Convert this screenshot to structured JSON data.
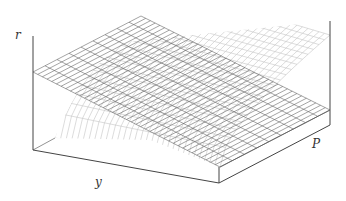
{
  "figure": {
    "type": "3d-surface-plot",
    "axes": {
      "vertical_label": "r",
      "front_label": "y",
      "side_label": "P"
    },
    "surfaces": [
      {
        "name": "plane",
        "style": "dark-grid",
        "color": "#555555"
      },
      {
        "name": "curved-surface",
        "style": "light-grid",
        "color": "#bbbbbb"
      }
    ],
    "box_color": "#444444"
  }
}
